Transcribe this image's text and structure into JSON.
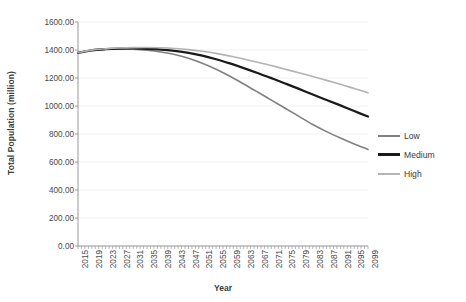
{
  "chart_data": {
    "type": "line",
    "title": "",
    "xlabel": "Year",
    "ylabel": "Total Population (million)",
    "ylim": [
      0,
      1600
    ],
    "ytick_values": [
      0,
      200,
      400,
      600,
      800,
      1000,
      1200,
      1400,
      1600
    ],
    "ytick_labels": [
      "0.00",
      "200.00",
      "400.00",
      "600.00",
      "800.00",
      "1000.00",
      "1200.00",
      "1400.00",
      "1600.00"
    ],
    "xlim": [
      2015,
      2099
    ],
    "xtick_labels": [
      "2015",
      "2019",
      "2023",
      "2027",
      "2031",
      "2035",
      "2039",
      "2043",
      "2047",
      "2051",
      "2055",
      "2059",
      "2063",
      "2067",
      "2071",
      "2075",
      "2079",
      "2083",
      "2087",
      "2091",
      "2095",
      "2099"
    ],
    "grid": "horizontal-faint",
    "legend_position": "right",
    "x": [
      2015,
      2019,
      2023,
      2027,
      2031,
      2035,
      2039,
      2043,
      2047,
      2051,
      2055,
      2059,
      2063,
      2067,
      2071,
      2075,
      2079,
      2083,
      2087,
      2091,
      2095,
      2099
    ],
    "series": [
      {
        "name": "Low",
        "color": "#808080",
        "width": 1.6,
        "values": [
          1380,
          1398,
          1405,
          1407,
          1405,
          1398,
          1386,
          1368,
          1341,
          1305,
          1262,
          1212,
          1157,
          1100,
          1042,
          984,
          926,
          868,
          817,
          771,
          729,
          690
        ]
      },
      {
        "name": "Medium",
        "color": "#1a1a1a",
        "width": 2.3,
        "values": [
          1380,
          1398,
          1406,
          1410,
          1411,
          1409,
          1403,
          1393,
          1379,
          1359,
          1334,
          1304,
          1271,
          1236,
          1199,
          1161,
          1122,
          1082,
          1043,
          1004,
          964,
          925
        ]
      },
      {
        "name": "High",
        "color": "#b3b3b3",
        "width": 1.6,
        "values": [
          1380,
          1399,
          1408,
          1414,
          1417,
          1418,
          1416,
          1411,
          1403,
          1391,
          1376,
          1357,
          1336,
          1313,
          1289,
          1263,
          1237,
          1210,
          1183,
          1155,
          1125,
          1095
        ]
      }
    ]
  },
  "legend": {
    "items": [
      {
        "label": "Low"
      },
      {
        "label": "Medium"
      },
      {
        "label": "High"
      }
    ]
  }
}
